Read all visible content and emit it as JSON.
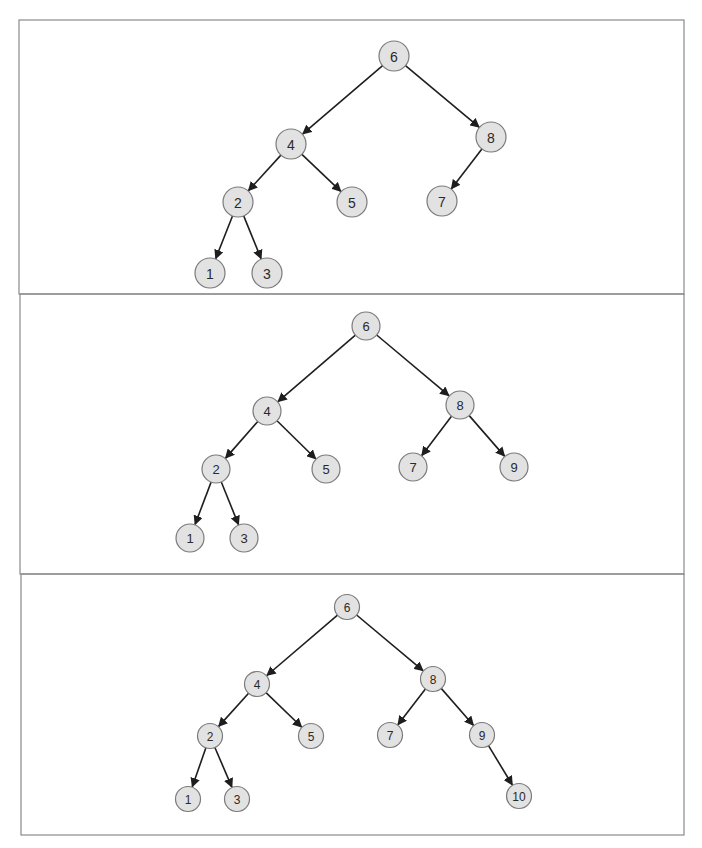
{
  "figure": {
    "title": "",
    "colors": {
      "node_fill": "#e2e2e2",
      "node_stroke": "#7a7a7a",
      "edge": "#1e1e1e",
      "frame": "#8a8a8a",
      "text": "#2a2a2a"
    }
  },
  "panels": [
    {
      "id": "panel-1",
      "frame": {
        "x": 19,
        "y": 20,
        "w": 665,
        "h": 274
      },
      "radius": 15,
      "font_size": 14,
      "nodes": [
        {
          "id": "6",
          "label": "6",
          "x": 394,
          "y": 56
        },
        {
          "id": "4",
          "label": "4",
          "x": 291,
          "y": 144
        },
        {
          "id": "8",
          "label": "8",
          "x": 491,
          "y": 137
        },
        {
          "id": "2",
          "label": "2",
          "x": 238,
          "y": 202
        },
        {
          "id": "5",
          "label": "5",
          "x": 352,
          "y": 202
        },
        {
          "id": "7",
          "label": "7",
          "x": 442,
          "y": 201
        },
        {
          "id": "1",
          "label": "1",
          "x": 210,
          "y": 273
        },
        {
          "id": "3",
          "label": "3",
          "x": 267,
          "y": 273
        }
      ],
      "edges": [
        {
          "from": "6",
          "to": "4"
        },
        {
          "from": "6",
          "to": "8"
        },
        {
          "from": "4",
          "to": "2"
        },
        {
          "from": "4",
          "to": "5"
        },
        {
          "from": "8",
          "to": "7"
        },
        {
          "from": "2",
          "to": "1"
        },
        {
          "from": "2",
          "to": "3"
        }
      ]
    },
    {
      "id": "panel-2",
      "frame": {
        "x": 20,
        "y": 294,
        "w": 664,
        "h": 280
      },
      "radius": 14,
      "font_size": 13,
      "nodes": [
        {
          "id": "6",
          "label": "6",
          "x": 366,
          "y": 326
        },
        {
          "id": "4",
          "label": "4",
          "x": 267,
          "y": 411
        },
        {
          "id": "8",
          "label": "8",
          "x": 460,
          "y": 405
        },
        {
          "id": "2",
          "label": "2",
          "x": 216,
          "y": 469
        },
        {
          "id": "5",
          "label": "5",
          "x": 326,
          "y": 469
        },
        {
          "id": "7",
          "label": "7",
          "x": 413,
          "y": 467
        },
        {
          "id": "9",
          "label": "9",
          "x": 514,
          "y": 467
        },
        {
          "id": "1",
          "label": "1",
          "x": 190,
          "y": 538
        },
        {
          "id": "3",
          "label": "3",
          "x": 244,
          "y": 538
        }
      ],
      "edges": [
        {
          "from": "6",
          "to": "4"
        },
        {
          "from": "6",
          "to": "8"
        },
        {
          "from": "4",
          "to": "2"
        },
        {
          "from": "4",
          "to": "5"
        },
        {
          "from": "8",
          "to": "7"
        },
        {
          "from": "8",
          "to": "9"
        },
        {
          "from": "2",
          "to": "1"
        },
        {
          "from": "2",
          "to": "3"
        }
      ]
    },
    {
      "id": "panel-3",
      "frame": {
        "x": 21,
        "y": 574,
        "w": 663,
        "h": 261
      },
      "radius": 12.5,
      "font_size": 12,
      "nodes": [
        {
          "id": "6",
          "label": "6",
          "x": 347,
          "y": 607
        },
        {
          "id": "4",
          "label": "4",
          "x": 257,
          "y": 684
        },
        {
          "id": "8",
          "label": "8",
          "x": 433,
          "y": 679
        },
        {
          "id": "2",
          "label": "2",
          "x": 210,
          "y": 736
        },
        {
          "id": "5",
          "label": "5",
          "x": 311,
          "y": 736
        },
        {
          "id": "7",
          "label": "7",
          "x": 390,
          "y": 735
        },
        {
          "id": "9",
          "label": "9",
          "x": 482,
          "y": 735
        },
        {
          "id": "1",
          "label": "1",
          "x": 188,
          "y": 799
        },
        {
          "id": "3",
          "label": "3",
          "x": 237,
          "y": 799
        },
        {
          "id": "10",
          "label": "10",
          "x": 519,
          "y": 796
        }
      ],
      "edges": [
        {
          "from": "6",
          "to": "4"
        },
        {
          "from": "6",
          "to": "8"
        },
        {
          "from": "4",
          "to": "2"
        },
        {
          "from": "4",
          "to": "5"
        },
        {
          "from": "8",
          "to": "7"
        },
        {
          "from": "8",
          "to": "9"
        },
        {
          "from": "2",
          "to": "1"
        },
        {
          "from": "2",
          "to": "3"
        },
        {
          "from": "9",
          "to": "10"
        }
      ]
    }
  ]
}
